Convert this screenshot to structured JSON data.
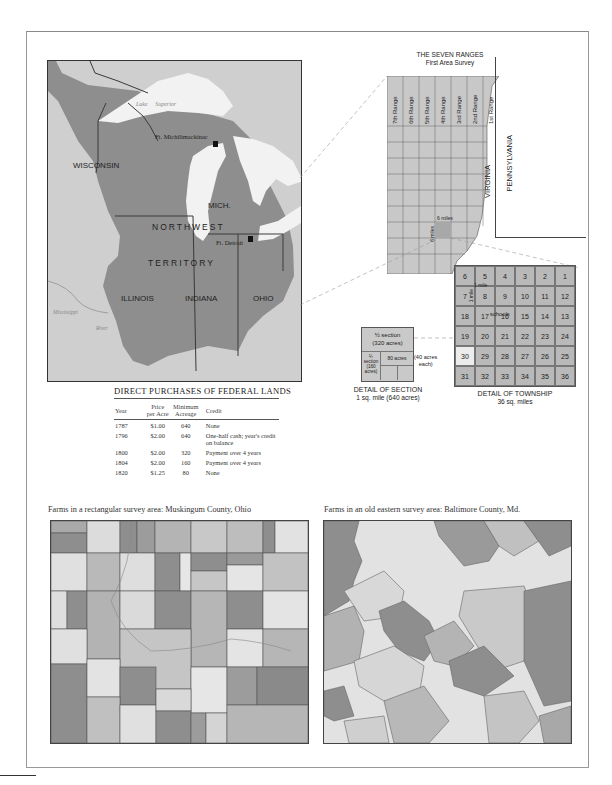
{
  "main_map": {
    "region_label_line1": "NORTHWEST",
    "region_label_line2": "TERRITORY",
    "states": [
      "WISCONSIN",
      "MICH.",
      "ILLINOIS",
      "INDIANA",
      "OHIO"
    ],
    "lakes": {
      "superior_1": "Lake",
      "superior_2": "Superior",
      "michigan_1": "Lake",
      "michigan_2": "Michigan",
      "huron_1": "Lake",
      "huron_2": "Huron",
      "erie_1": "Lake",
      "erie_2": "Erie"
    },
    "forts": [
      "Ft. Michilimackinac",
      "Ft. Detroit"
    ],
    "river_1": "Mississippi",
    "river_2": "River",
    "colors": {
      "land": "#8e8e8e",
      "outside": "#cfcfcf",
      "water": "#f2f2f2",
      "border": "#3a3a3a"
    }
  },
  "seven_ranges": {
    "title": "THE SEVEN RANGES",
    "subtitle": "First Area Survey",
    "ranges": [
      "7th Range",
      "6th Range",
      "5th Range",
      "4th Range",
      "3rd Range",
      "2nd Range",
      "1st Range"
    ],
    "virginia": "VIRGINIA",
    "pennsylvania": "PENNSYLVANIA",
    "six_miles_h": "6 miles",
    "six_miles_v": "6 miles"
  },
  "township": {
    "rows": [
      [
        "6",
        "5",
        "4",
        "3",
        "2",
        "1"
      ],
      [
        "7",
        "8",
        "9",
        "10",
        "11",
        "12"
      ],
      [
        "18",
        "17",
        "16",
        "15",
        "14",
        "13"
      ],
      [
        "19",
        "20",
        "21",
        "22",
        "23",
        "24"
      ],
      [
        "30",
        "29",
        "28",
        "27",
        "26",
        "25"
      ],
      [
        "31",
        "32",
        "33",
        "34",
        "35",
        "36"
      ]
    ],
    "one_mile_h": "1 mile",
    "one_mile_v": "1 mile",
    "schools": "schools",
    "caption_line1": "DETAIL OF TOWNSHIP",
    "caption_line2": "36 sq. miles"
  },
  "section": {
    "half_line1": "½ section",
    "half_line2": "(320 acres)",
    "quarter_line1": "¼",
    "quarter_line2": "section",
    "quarter_line3": "(160",
    "quarter_line4": "acres)",
    "eighty": "80 acres",
    "forty_line1": "(40 acres",
    "forty_line2": "each)",
    "caption_line1": "DETAIL OF SECTION",
    "caption_line2": "1 sq. mile  (640 acres)"
  },
  "purchases_table": {
    "title": "DIRECT PURCHASES OF FEDERAL LANDS",
    "headers": {
      "year": "Year",
      "price_1": "Price",
      "price_2": "per Acre",
      "min_1": "Minimum",
      "min_2": "Acreage",
      "credit": "Credit"
    },
    "rows": [
      {
        "year": "1787",
        "price": "$1.00",
        "acreage": "640",
        "credit": "None"
      },
      {
        "year": "1796",
        "price": "$2.00",
        "acreage": "640",
        "credit": "One-half cash; year's credit on balance"
      },
      {
        "year": "1800",
        "price": "$2.00",
        "acreage": "320",
        "credit": "Payment over 4 years"
      },
      {
        "year": "1804",
        "price": "$2.00",
        "acreage": "160",
        "credit": "Payment over 4 years"
      },
      {
        "year": "1820",
        "price": "$1.25",
        "acreage": "80",
        "credit": "None"
      }
    ]
  },
  "farms": {
    "rectangular_caption": "Farms in a rectangular survey area: Muskingum County, Ohio",
    "eastern_caption": "Farms in an old eastern survey area: Baltimore County, Md."
  }
}
